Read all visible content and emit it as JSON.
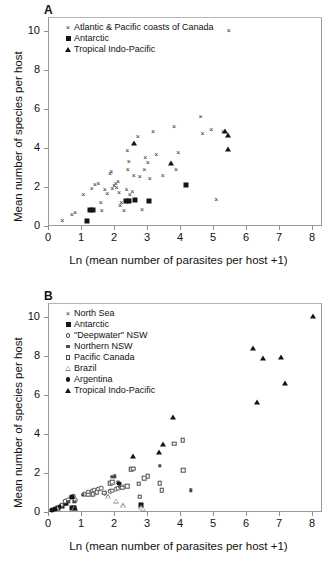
{
  "figure": {
    "panels": [
      {
        "letter": "A",
        "xlabel": "Ln (mean number of parasites per host +1)",
        "ylabel": "Mean number of species per host",
        "xticks": [
          "0",
          "1",
          "2",
          "3",
          "4",
          "5",
          "6",
          "7",
          "8"
        ],
        "yticks": [
          "0",
          "2",
          "4",
          "6",
          "8",
          "10"
        ],
        "legend": [
          {
            "symbol": "cross",
            "label": "Atlantic & Pacific coasts of Canada"
          },
          {
            "symbol": "square-filled",
            "label": "Antarctic"
          },
          {
            "symbol": "triangle-filled",
            "label": "Tropical Indo-Pacific"
          }
        ]
      },
      {
        "letter": "B",
        "xlabel": "Ln (mean number of parasites per host +1)",
        "ylabel": "Mean number of species per host",
        "xticks": [
          "0",
          "1",
          "2",
          "3",
          "4",
          "5",
          "6",
          "7",
          "8"
        ],
        "yticks": [
          "0",
          "2",
          "4",
          "6",
          "8",
          "10"
        ],
        "legend": [
          {
            "symbol": "cross",
            "label": "North Sea"
          },
          {
            "symbol": "square-filled",
            "label": "Antarctic"
          },
          {
            "symbol": "circle-open",
            "label": "\"Deepwater\" NSW"
          },
          {
            "symbol": "square-small-filled",
            "label": "Northern NSW"
          },
          {
            "symbol": "square-open",
            "label": "Pacific Canada"
          },
          {
            "symbol": "triangle-open",
            "label": "Brazil"
          },
          {
            "symbol": "circle-filled",
            "label": "Argentina"
          },
          {
            "symbol": "triangle-filled",
            "label": "Tropical Indo-Pacific"
          }
        ]
      }
    ]
  },
  "chart_data": [
    {
      "type": "scatter",
      "panel": "A",
      "title": "A",
      "xlabel": "Ln (mean number of parasites per host +1)",
      "ylabel": "Mean number of species per host",
      "xlim": [
        0,
        8.3
      ],
      "ylim": [
        0,
        10.7
      ],
      "xticks": [
        0,
        1,
        2,
        3,
        4,
        5,
        6,
        7,
        8
      ],
      "yticks": [
        0,
        2,
        4,
        6,
        8,
        10
      ],
      "grid": false,
      "legend_position": "top-left",
      "series": [
        {
          "name": "Atlantic & Pacific coasts of Canada",
          "marker": "cross",
          "points": [
            [
              0.43,
              0.3
            ],
            [
              0.72,
              0.62
            ],
            [
              0.82,
              0.72
            ],
            [
              1.07,
              1.62
            ],
            [
              1.33,
              1.92
            ],
            [
              1.42,
              2.13
            ],
            [
              1.52,
              2.22
            ],
            [
              1.6,
              1.25
            ],
            [
              1.63,
              0.82
            ],
            [
              1.72,
              1.9
            ],
            [
              1.8,
              1.68
            ],
            [
              1.88,
              2.72
            ],
            [
              1.92,
              2.8
            ],
            [
              1.95,
              1.95
            ],
            [
              2.0,
              2.08
            ],
            [
              2.05,
              2.2
            ],
            [
              2.08,
              2.02
            ],
            [
              2.12,
              2.32
            ],
            [
              2.15,
              1.72
            ],
            [
              2.18,
              1.1
            ],
            [
              2.22,
              1.25
            ],
            [
              2.3,
              0.82
            ],
            [
              2.38,
              1.88
            ],
            [
              2.4,
              3.9
            ],
            [
              2.42,
              2.9
            ],
            [
              2.45,
              3.32
            ],
            [
              2.48,
              1.62
            ],
            [
              2.55,
              1.8
            ],
            [
              2.6,
              2.6
            ],
            [
              2.72,
              4.62
            ],
            [
              2.78,
              2.55
            ],
            [
              2.85,
              0.85
            ],
            [
              2.92,
              2.9
            ],
            [
              2.95,
              3.55
            ],
            [
              3.02,
              3.3
            ],
            [
              3.08,
              2.45
            ],
            [
              3.18,
              4.88
            ],
            [
              3.28,
              3.68
            ],
            [
              3.48,
              2.62
            ],
            [
              3.72,
              3.2
            ],
            [
              3.82,
              5.12
            ],
            [
              3.88,
              2.9
            ],
            [
              3.95,
              3.8
            ],
            [
              4.62,
              5.65
            ],
            [
              4.68,
              4.75
            ],
            [
              4.95,
              4.95
            ],
            [
              5.1,
              1.38
            ],
            [
              5.3,
              4.85
            ],
            [
              5.48,
              10.02
            ]
          ]
        },
        {
          "name": "Antarctic",
          "marker": "square-filled",
          "points": [
            [
              1.18,
              0.25
            ],
            [
              1.28,
              0.8
            ],
            [
              1.35,
              0.82
            ],
            [
              2.35,
              1.28
            ],
            [
              2.45,
              1.3
            ],
            [
              2.65,
              1.32
            ],
            [
              3.05,
              1.3
            ],
            [
              4.18,
              2.12
            ]
          ]
        },
        {
          "name": "Tropical Indo-Pacific",
          "marker": "triangle-filled",
          "points": [
            [
              2.62,
              4.25
            ],
            [
              3.72,
              3.22
            ],
            [
              5.35,
              4.85
            ],
            [
              5.45,
              4.68
            ],
            [
              5.45,
              3.95
            ]
          ]
        }
      ]
    },
    {
      "type": "scatter",
      "panel": "B",
      "title": "B",
      "xlabel": "Ln (mean number of parasites per host +1)",
      "ylabel": "Mean number of species per host",
      "xlim": [
        0,
        8.3
      ],
      "ylim": [
        0,
        10.7
      ],
      "xticks": [
        0,
        1,
        2,
        3,
        4,
        5,
        6,
        7,
        8
      ],
      "yticks": [
        0,
        2,
        4,
        6,
        8,
        10
      ],
      "grid": false,
      "legend_position": "top-left",
      "series": [
        {
          "name": "North Sea",
          "marker": "cross",
          "points": [
            [
              0.08,
              0.08
            ],
            [
              0.55,
              0.42
            ],
            [
              0.8,
              0.55
            ],
            [
              1.45,
              1.02
            ],
            [
              1.92,
              1.12
            ],
            [
              2.1,
              1.55
            ],
            [
              2.12,
              1.58
            ]
          ]
        },
        {
          "name": "Antarctic",
          "marker": "square-filled",
          "points": [
            [
              0.3,
              0.22
            ],
            [
              0.42,
              0.32
            ],
            [
              0.55,
              0.45
            ],
            [
              0.72,
              0.22
            ],
            [
              0.78,
              0.22
            ],
            [
              2.82,
              0.38
            ]
          ]
        },
        {
          "name": "\"Deepwater\" NSW",
          "marker": "circle-open",
          "points": [
            [
              0.3,
              0.18
            ],
            [
              0.42,
              0.35
            ],
            [
              0.52,
              0.55
            ],
            [
              0.62,
              0.62
            ],
            [
              0.7,
              0.78
            ],
            [
              0.78,
              0.8
            ],
            [
              0.82,
              0.6
            ],
            [
              1.1,
              0.92
            ],
            [
              1.22,
              1.0
            ],
            [
              1.32,
              1.08
            ],
            [
              1.4,
              1.12
            ],
            [
              1.52,
              1.18
            ],
            [
              1.62,
              1.22
            ],
            [
              1.72,
              0.95
            ],
            [
              1.88,
              1.05
            ],
            [
              1.95,
              1.1
            ],
            [
              2.05,
              1.18
            ],
            [
              2.12,
              1.22
            ],
            [
              2.2,
              1.25
            ],
            [
              2.28,
              1.3
            ]
          ]
        },
        {
          "name": "Northern NSW",
          "marker": "square-small-filled",
          "points": [
            [
              0.62,
              0.52
            ],
            [
              0.8,
              0.52
            ],
            [
              1.05,
              0.88
            ],
            [
              1.3,
              0.92
            ],
            [
              1.42,
              0.95
            ],
            [
              1.95,
              1.8
            ],
            [
              2.02,
              1.82
            ],
            [
              2.18,
              1.28
            ],
            [
              3.38,
              2.38
            ],
            [
              4.32,
              1.12
            ]
          ]
        },
        {
          "name": "Pacific Canada",
          "marker": "square-open",
          "points": [
            [
              1.22,
              0.88
            ],
            [
              1.35,
              0.92
            ],
            [
              1.48,
              1.02
            ],
            [
              1.7,
              0.98
            ],
            [
              1.88,
              1.48
            ],
            [
              1.95,
              1.52
            ],
            [
              2.25,
              1.25
            ],
            [
              2.4,
              1.32
            ],
            [
              2.52,
              2.18
            ],
            [
              2.58,
              2.22
            ],
            [
              2.75,
              1.45
            ],
            [
              2.78,
              0.78
            ],
            [
              2.92,
              1.72
            ],
            [
              3.02,
              1.82
            ],
            [
              3.38,
              1.48
            ],
            [
              3.45,
              1.12
            ],
            [
              3.82,
              3.5
            ],
            [
              4.08,
              3.68
            ],
            [
              4.1,
              2.15
            ]
          ]
        },
        {
          "name": "Brazil",
          "marker": "triangle-open",
          "points": [
            [
              0.78,
              0.2
            ],
            [
              1.82,
              1.05
            ],
            [
              2.05,
              1.1
            ],
            [
              2.28,
              1.12
            ],
            [
              2.82,
              1.28
            ],
            [
              2.88,
              1.45
            ]
          ]
        },
        {
          "name": "Argentina",
          "marker": "circle-filled",
          "points": [
            [
              0.12,
              0.1
            ],
            [
              0.22,
              0.15
            ],
            [
              0.35,
              0.28
            ],
            [
              0.72,
              0.78
            ],
            [
              2.15,
              1.45
            ]
          ]
        },
        {
          "name": "Tropical Indo-Pacific",
          "marker": "triangle-filled",
          "points": [
            [
              0.82,
              0.18
            ],
            [
              2.58,
              2.88
            ],
            [
              3.35,
              3.05
            ],
            [
              3.48,
              3.48
            ],
            [
              3.78,
              4.88
            ],
            [
              6.22,
              8.42
            ],
            [
              6.32,
              5.62
            ],
            [
              6.52,
              7.88
            ],
            [
              7.05,
              7.95
            ],
            [
              7.18,
              6.62
            ],
            [
              8.02,
              10.02
            ]
          ]
        }
      ]
    }
  ]
}
